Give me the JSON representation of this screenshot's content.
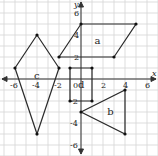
{
  "diagram": {
    "type": "coordinate-grid-shapes",
    "axes": {
      "x_label": "x",
      "y_label": "y",
      "x_ticks": [
        -6,
        -4,
        -2,
        0,
        2,
        4,
        6
      ],
      "y_ticks": [
        -6,
        -4,
        -2,
        2,
        4,
        6
      ],
      "x_range": [
        -7,
        7
      ],
      "y_range": [
        -7,
        7
      ],
      "origin_label": "0",
      "grid": true
    },
    "shapes": [
      {
        "label": "a",
        "type": "parallelogram",
        "points": [
          [
            -2,
            2
          ],
          [
            0,
            5
          ],
          [
            5,
            5
          ],
          [
            3,
            2
          ]
        ]
      },
      {
        "label": "b",
        "type": "triangle",
        "points": [
          [
            0,
            -3
          ],
          [
            4,
            -1
          ],
          [
            4,
            -5
          ]
        ]
      },
      {
        "label": "c",
        "type": "kite",
        "points": [
          [
            -4,
            4
          ],
          [
            -2,
            1
          ],
          [
            -4,
            -5
          ],
          [
            -6,
            1
          ]
        ]
      },
      {
        "label": "d",
        "type": "rectangle",
        "points": [
          [
            -1,
            1
          ],
          [
            1,
            1
          ],
          [
            1,
            -2
          ],
          [
            -1,
            -2
          ]
        ]
      }
    ],
    "colors": {
      "grid": "#cfcfcf",
      "axis": "#333333",
      "shape": "#2a2a2a"
    }
  }
}
